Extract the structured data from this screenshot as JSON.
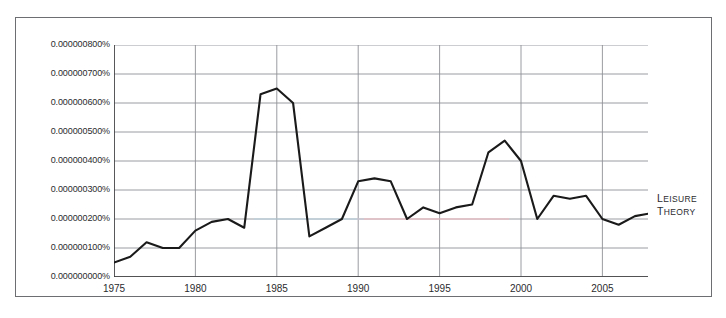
{
  "page": {
    "top_faint_text": "",
    "bottom_faint_text": ""
  },
  "legend": {
    "line1": "Leisure",
    "line2": "Theory",
    "position": "right-of-plot"
  },
  "axis": {
    "y_ticks": [
      "0.000000800%",
      "0.000000700%",
      "0.000000600%",
      "0.000000500%",
      "0.000000400%",
      "0.000000300%",
      "0.000000200%",
      "0.000000100%",
      "0.000000000%"
    ],
    "x_ticks": [
      "1975",
      "1980",
      "1985",
      "1990",
      "1995",
      "2000",
      "2005"
    ]
  },
  "colors": {
    "line": "#1a1a1a",
    "grid": "#8f9196",
    "axis": "#3a3a3d",
    "frame": "#6d6e72",
    "text": "#2b2b2e",
    "background": "#ffffff"
  },
  "chart_data": {
    "type": "line",
    "title": "",
    "xlabel": "",
    "ylabel": "",
    "xlim": [
      1975,
      2008
    ],
    "ylim": [
      0.0,
      8e-07
    ],
    "grid": true,
    "legend": "Leisure Theory",
    "y_unit": "percent",
    "x": [
      1975,
      1976,
      1977,
      1978,
      1979,
      1980,
      1981,
      1982,
      1983,
      1984,
      1985,
      1986,
      1987,
      1988,
      1989,
      1990,
      1991,
      1992,
      1993,
      1994,
      1995,
      1996,
      1997,
      1998,
      1999,
      2000,
      2001,
      2002,
      2003,
      2004,
      2005,
      2006,
      2007,
      2008
    ],
    "series": [
      {
        "name": "Leisure Theory",
        "values": [
          5e-08,
          7e-08,
          1.2e-07,
          1e-07,
          1e-07,
          1.6e-07,
          1.9e-07,
          2e-07,
          1.7e-07,
          6.3e-07,
          6.5e-07,
          6e-07,
          1.4e-07,
          1.7e-07,
          2e-07,
          3.3e-07,
          3.4e-07,
          3.3e-07,
          2e-07,
          2.4e-07,
          2.2e-07,
          2.4e-07,
          2.5e-07,
          4.3e-07,
          4.7e-07,
          4e-07,
          2e-07,
          2.8e-07,
          2.7e-07,
          2.8e-07,
          2e-07,
          1.8e-07,
          2.1e-07,
          2.2e-07
        ]
      }
    ]
  }
}
